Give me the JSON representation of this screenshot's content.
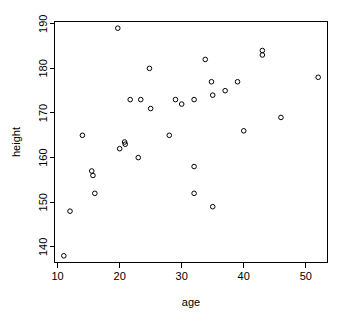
{
  "chart_data": {
    "type": "scatter",
    "title": "",
    "xlabel": "age",
    "ylabel": "height",
    "xlim": [
      9.5,
      53.5
    ],
    "ylim": [
      136.5,
      190.5
    ],
    "xticks": [
      10,
      20,
      30,
      40,
      50
    ],
    "yticks": [
      140,
      150,
      160,
      170,
      180,
      190
    ],
    "grid": false,
    "legend": null,
    "point_marker": "open-circle",
    "point_color": "#000000",
    "background_color": "#ffffff",
    "points": [
      {
        "x": 11,
        "y": 138
      },
      {
        "x": 12,
        "y": 148
      },
      {
        "x": 14,
        "y": 165
      },
      {
        "x": 15.5,
        "y": 157
      },
      {
        "x": 15.7,
        "y": 156
      },
      {
        "x": 16,
        "y": 152
      },
      {
        "x": 19.7,
        "y": 189
      },
      {
        "x": 20,
        "y": 162
      },
      {
        "x": 20.8,
        "y": 163.5
      },
      {
        "x": 20.9,
        "y": 163
      },
      {
        "x": 21.7,
        "y": 173
      },
      {
        "x": 23,
        "y": 160
      },
      {
        "x": 23.4,
        "y": 173
      },
      {
        "x": 24.8,
        "y": 180
      },
      {
        "x": 25,
        "y": 171
      },
      {
        "x": 28,
        "y": 165
      },
      {
        "x": 29,
        "y": 173
      },
      {
        "x": 30,
        "y": 172
      },
      {
        "x": 32,
        "y": 173
      },
      {
        "x": 32,
        "y": 158
      },
      {
        "x": 32,
        "y": 152
      },
      {
        "x": 33.8,
        "y": 182
      },
      {
        "x": 34.8,
        "y": 177
      },
      {
        "x": 35,
        "y": 174
      },
      {
        "x": 35,
        "y": 149
      },
      {
        "x": 37,
        "y": 175
      },
      {
        "x": 39,
        "y": 177
      },
      {
        "x": 40,
        "y": 166
      },
      {
        "x": 43,
        "y": 184
      },
      {
        "x": 43,
        "y": 183
      },
      {
        "x": 46,
        "y": 169
      },
      {
        "x": 52,
        "y": 178
      }
    ]
  },
  "axis": {
    "x_tick_labels": [
      "10",
      "20",
      "30",
      "40",
      "50"
    ],
    "y_tick_labels": [
      "140",
      "150",
      "160",
      "170",
      "180",
      "190"
    ],
    "x_axis_title": "age",
    "y_axis_title": "height"
  }
}
